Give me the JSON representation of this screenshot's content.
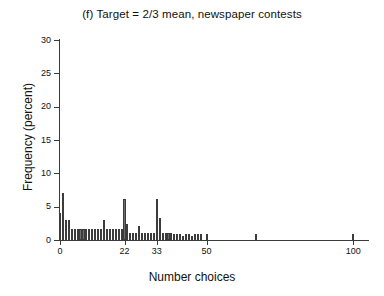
{
  "figure": {
    "title": "(f) Target = 2/3 mean, newspaper contests",
    "xlabel": "Number choices",
    "ylabel": "Frequency (percent)"
  },
  "chart_data": {
    "type": "bar",
    "title": "(f) Target = 2/3 mean, newspaper contests",
    "xlabel": "Number choices",
    "ylabel": "Frequency (percent)",
    "xlim": [
      0,
      103
    ],
    "ylim": [
      0,
      30
    ],
    "grid": false,
    "legend": null,
    "xticks": [
      0,
      22,
      33,
      50,
      100
    ],
    "xtick_labels": [
      "0",
      "22",
      "33",
      "50",
      "100"
    ],
    "yticks": [
      0,
      5,
      10,
      15,
      20,
      25,
      30
    ],
    "ytick_labels": [
      "0",
      "5",
      "10",
      "15",
      "20",
      "25",
      "30"
    ],
    "bar_color": "#6e6e6e",
    "bar_edge_color": "#3c3c3c",
    "x": [
      0,
      1,
      2,
      3,
      4,
      5,
      6,
      7,
      8,
      9,
      10,
      11,
      12,
      13,
      14,
      15,
      16,
      17,
      18,
      19,
      20,
      21,
      22,
      23,
      24,
      25,
      26,
      27,
      28,
      29,
      30,
      31,
      32,
      33,
      34,
      35,
      36,
      37,
      38,
      39,
      40,
      41,
      42,
      43,
      44,
      45,
      46,
      47,
      48,
      49,
      50,
      52,
      55,
      58,
      60,
      65,
      67,
      70,
      75,
      80,
      100
    ],
    "values": [
      4.0,
      7.0,
      3.0,
      3.0,
      1.6,
      1.6,
      1.6,
      1.6,
      1.6,
      1.6,
      1.6,
      1.6,
      1.6,
      1.6,
      1.6,
      3.0,
      1.6,
      1.6,
      1.6,
      1.6,
      1.6,
      1.6,
      6.1,
      2.4,
      1.1,
      1.1,
      1.1,
      2.1,
      1.1,
      1.1,
      1.1,
      1.1,
      1.1,
      6.1,
      3.3,
      1.1,
      1.1,
      1.1,
      1.1,
      0.9,
      0.9,
      0.9,
      0.6,
      0.9,
      0.9,
      0.6,
      0.9,
      0.9,
      0.9,
      0.0,
      0.9,
      0.0,
      0.0,
      0.0,
      0.0,
      0.0,
      0.9,
      0.0,
      0.0,
      0.0,
      0.9
    ]
  }
}
